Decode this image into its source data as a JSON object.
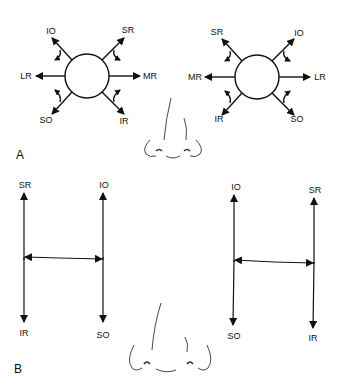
{
  "figure": {
    "panels": [
      {
        "id": "A",
        "label": "A",
        "description": "Diagnostic positions of gaze — muscle action diagrams",
        "right_eye": {
          "muscles": {
            "top_left": "IO",
            "top_right": "SR",
            "left": "LR",
            "right": "MR",
            "bottom_left": "SO",
            "bottom_right": "IR"
          }
        },
        "left_eye": {
          "muscles": {
            "top_left": "SR",
            "top_right": "IO",
            "left": "MR",
            "right": "LR",
            "bottom_left": "IR",
            "bottom_right": "SO"
          }
        }
      },
      {
        "id": "B",
        "label": "B",
        "description": "H-pattern of cardinal positions",
        "right_eye": {
          "muscles": {
            "top_left": "SR",
            "top_right": "IO",
            "bottom_left": "IR",
            "bottom_right": "SO"
          }
        },
        "left_eye": {
          "muscles": {
            "top_left": "IO",
            "top_right": "SR",
            "bottom_left": "SO",
            "bottom_right": "IR"
          }
        }
      }
    ],
    "icons": [
      "nose-drawing-icon",
      "eye-circle-icon",
      "arrow-icon"
    ],
    "colors": {
      "line": "#111111",
      "background": "#ffffff"
    }
  }
}
